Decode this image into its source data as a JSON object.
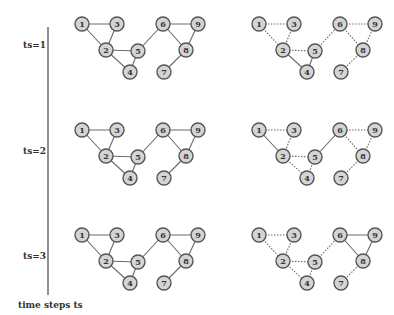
{
  "figure": {
    "axis_caption": "time steps ts",
    "colors": {
      "node_fill": "#d4d4d4",
      "node_stroke": "#555555",
      "edge": "#6a6a6a",
      "axis": "#555555",
      "text": "#333333"
    },
    "nodes": [
      {
        "id": "1",
        "x": 0,
        "y": 0
      },
      {
        "id": "3",
        "x": 35,
        "y": 0
      },
      {
        "id": "2",
        "x": 24,
        "y": 26
      },
      {
        "id": "5",
        "x": 56,
        "y": 27
      },
      {
        "id": "4",
        "x": 48,
        "y": 48
      },
      {
        "id": "6",
        "x": 81,
        "y": 0
      },
      {
        "id": "9",
        "x": 116,
        "y": 0
      },
      {
        "id": "8",
        "x": 104,
        "y": 26
      },
      {
        "id": "7",
        "x": 82,
        "y": 48
      }
    ],
    "edges": [
      [
        "1",
        "3"
      ],
      [
        "1",
        "2"
      ],
      [
        "3",
        "2"
      ],
      [
        "2",
        "5"
      ],
      [
        "2",
        "4"
      ],
      [
        "4",
        "5"
      ],
      [
        "5",
        "6"
      ],
      [
        "6",
        "9"
      ],
      [
        "6",
        "8"
      ],
      [
        "9",
        "8"
      ],
      [
        "8",
        "7"
      ]
    ],
    "rows": [
      {
        "label": "ts=1",
        "solid_edges_right": [
          [
            "2",
            "4"
          ],
          [
            "4",
            "5"
          ]
        ]
      },
      {
        "label": "ts=2",
        "solid_edges_right": [
          [
            "1",
            "2"
          ],
          [
            "5",
            "6"
          ]
        ]
      },
      {
        "label": "ts=3",
        "solid_edges_right": [
          [
            "6",
            "9"
          ],
          [
            "6",
            "8"
          ],
          [
            "9",
            "8"
          ]
        ]
      }
    ]
  }
}
